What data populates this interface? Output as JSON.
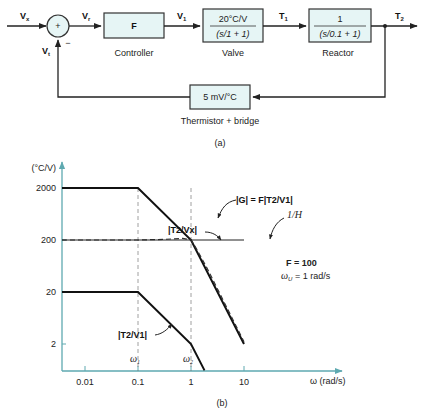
{
  "diagram_a": {
    "caption": "(a)",
    "signals": {
      "input": "V",
      "input_sub": "x",
      "error": "V",
      "error_sub": "r",
      "feedback": "V",
      "feedback_sub": "t",
      "controller_out": "V",
      "controller_out_sub": "1",
      "valve_out": "T",
      "valve_out_sub": "1",
      "output": "T",
      "output_sub": "2"
    },
    "summer": {
      "plus": "+",
      "minus": "−"
    },
    "blocks": {
      "controller": {
        "content": "F",
        "label": "Controller"
      },
      "valve": {
        "numerator": "20°C/V",
        "denominator": "(s/1 + 1)",
        "label": "Valve"
      },
      "reactor": {
        "numerator": "1",
        "denominator": "(s/0.1 + 1)",
        "label": "Reactor"
      },
      "sensor": {
        "content": "5 mV/°C",
        "label": "Thermistor + bridge"
      }
    }
  },
  "chart_data": {
    "type": "line",
    "caption": "(b)",
    "xscale": "log",
    "yscale": "log",
    "xlim": [
      0.003,
      20
    ],
    "ylim": [
      1,
      3000
    ],
    "ylabel": "(°C/V)",
    "xlabel": "ω (rad/s)",
    "xticks": [
      {
        "value": 0.01,
        "label": "0.01"
      },
      {
        "value": 0.1,
        "label": "0.1"
      },
      {
        "value": 1,
        "label": "1"
      },
      {
        "value": 10,
        "label": "10"
      }
    ],
    "yticks": [
      {
        "value": 2000,
        "label": "2000"
      },
      {
        "value": 200,
        "label": "200"
      },
      {
        "value": 20,
        "label": "20"
      },
      {
        "value": 2,
        "label": "2"
      }
    ],
    "series": [
      {
        "name": "|G| = F|T2/V1|",
        "style": "solid-thick",
        "points": [
          [
            0.003,
            2000
          ],
          [
            0.1,
            2000
          ],
          [
            1,
            200
          ],
          [
            10,
            2
          ]
        ]
      },
      {
        "name": "|T2/V1|",
        "style": "solid-thick",
        "points": [
          [
            0.003,
            20
          ],
          [
            0.1,
            20
          ],
          [
            1,
            2
          ],
          [
            1.8,
            0.62
          ]
        ]
      },
      {
        "name": "|T2/Vx|",
        "style": "dashed",
        "points": [
          [
            0.003,
            200
          ],
          [
            0.1,
            200
          ],
          [
            0.3,
            205
          ],
          [
            0.7,
            215
          ],
          [
            1,
            200
          ],
          [
            1.2,
            150
          ],
          [
            2,
            58
          ],
          [
            10,
            2.2
          ]
        ]
      },
      {
        "name": "1/H",
        "style": "solid-thin",
        "points": [
          [
            0.003,
            200
          ],
          [
            10,
            200
          ]
        ]
      }
    ],
    "guides": [
      {
        "x": 0.1,
        "label": "ω",
        "label_sub": "1"
      },
      {
        "x": 1,
        "label": "ω",
        "label_sub": "2"
      }
    ],
    "annotations": {
      "G_label": "|G| = F|T2/V1|",
      "T2Vx_label": "|T2/Vx|",
      "T2V1_label": "|T2/V1|",
      "invH_label": "1/H",
      "params_F": "F = 100",
      "params_wU_symbol": "ω",
      "params_wU_sub": "U",
      "params_wU_value": " = 1 rad/s"
    }
  }
}
